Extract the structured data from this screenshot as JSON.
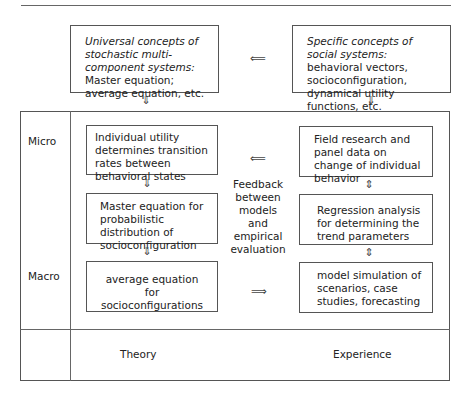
{
  "top_left": {
    "italic": "Universal concepts of stochastic multi-component systems:",
    "rest": " Master equation; average equation, etc."
  },
  "top_right": {
    "italic": "Specific concepts of social systems:",
    "rest": " behavioral vectors, socioconfiguration, dynamical utility functions, etc."
  },
  "rows": {
    "micro": "Micro",
    "macro": "Macro"
  },
  "theory": {
    "box1": "Individual utility determines transition rates between behavioral states",
    "box2": "Master equation for probabilistic distribution of socioconfiguration",
    "box3": "average equation for socioconfigurations",
    "footer": "Theory"
  },
  "experience": {
    "box1": "Field research and panel data on change of individual behavior",
    "box2": "Regression analysis for determining the trend parameters",
    "box3": "model simulation of scenarios, case studies, forecasting",
    "footer": "Experience"
  },
  "middle_label": "Feedback between models and empirical evaluation",
  "arrows": {
    "left": "⟸",
    "right": "⟹",
    "down": "⇓",
    "updown": "⇕"
  }
}
